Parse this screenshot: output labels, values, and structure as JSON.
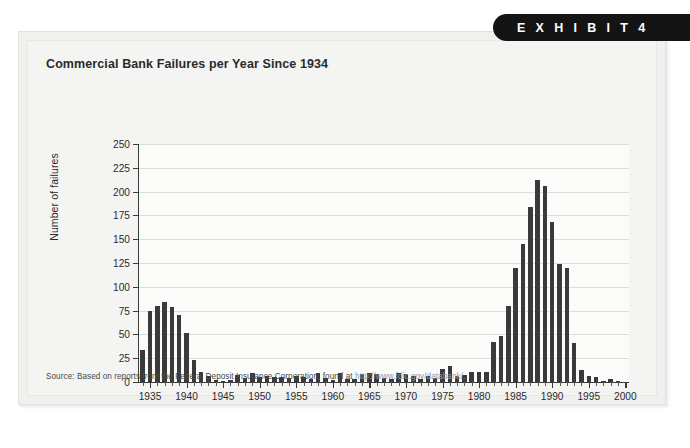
{
  "exhibit": {
    "label": "E X H I B I T   4"
  },
  "chart_title": "Commercial Bank Failures per Year Since 1934",
  "source": {
    "prefix": "Source: Based on reports from the Federal Deposit Insurance Corporation, found at ",
    "url": "http://www.fdic.gov/databank/."
  },
  "colors": {
    "bar": "#3a3a3a",
    "axis": "#3a3a3a",
    "gridline": "#dededa",
    "panel": "#f0f0ee",
    "panel_inner": "#f4f4f2",
    "plot_background": "#fbfbfa",
    "pill_background": "#141414",
    "pill_text": "#ffffff",
    "url_text": "#8e9aa6"
  },
  "chart_data": {
    "type": "bar",
    "title": "Commercial Bank Failures per Year Since 1934",
    "xlabel": "",
    "ylabel": "Number of failures",
    "ylim": [
      0,
      250
    ],
    "xlim": [
      1933.5,
      2000.5
    ],
    "ytick_values": [
      0,
      25,
      50,
      75,
      100,
      125,
      150,
      175,
      200,
      225,
      250
    ],
    "ytick_labels": [
      "0",
      "25",
      "50",
      "75",
      "100",
      "125",
      "150",
      "175",
      "200",
      "225",
      "250"
    ],
    "xtick_values": [
      1935,
      1940,
      1945,
      1950,
      1955,
      1960,
      1965,
      1970,
      1975,
      1980,
      1985,
      1990,
      1995,
      2000
    ],
    "xtick_labels": [
      "1935",
      "1940",
      "1945",
      "1950",
      "1955",
      "1960",
      "1965",
      "1970",
      "1975",
      "1980",
      "1985",
      "1990",
      "1995",
      "2000"
    ],
    "grid": true,
    "legend": false,
    "categories": [
      1934,
      1935,
      1936,
      1937,
      1938,
      1939,
      1940,
      1941,
      1942,
      1943,
      1944,
      1945,
      1946,
      1947,
      1948,
      1949,
      1950,
      1951,
      1952,
      1953,
      1954,
      1955,
      1956,
      1957,
      1958,
      1959,
      1960,
      1961,
      1962,
      1963,
      1964,
      1965,
      1966,
      1967,
      1968,
      1969,
      1970,
      1971,
      1972,
      1973,
      1974,
      1975,
      1976,
      1977,
      1978,
      1979,
      1980,
      1981,
      1982,
      1983,
      1984,
      1985,
      1986,
      1987,
      1988,
      1989,
      1990,
      1991,
      1992,
      1993,
      1994,
      1995,
      1996,
      1997,
      1998,
      1999
    ],
    "values": [
      34,
      75,
      80,
      84,
      79,
      70,
      52,
      23,
      11,
      6,
      2,
      1,
      2,
      7,
      4,
      9,
      5,
      6,
      5,
      5,
      4,
      6,
      5,
      3,
      9,
      4,
      2,
      9,
      3,
      3,
      8,
      9,
      8,
      4,
      3,
      9,
      8,
      6,
      3,
      6,
      4,
      14,
      17,
      6,
      7,
      10,
      11,
      10,
      42,
      48,
      80,
      120,
      145,
      184,
      212,
      206,
      168,
      124,
      120,
      41,
      13,
      6,
      5,
      1,
      3,
      1
    ]
  }
}
